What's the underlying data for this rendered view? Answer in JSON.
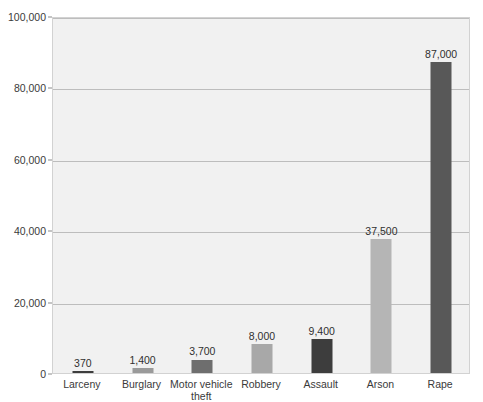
{
  "chart_data": {
    "type": "bar",
    "title": "",
    "subtitle": "",
    "xlabel": "",
    "ylabel": "",
    "categories": [
      "Larceny",
      "Burglary",
      "Motor vehicle\ntheft",
      "Robbery",
      "Assault",
      "Arson",
      "Rape"
    ],
    "values": [
      370,
      1400,
      3700,
      8000,
      9400,
      37500,
      87000
    ],
    "value_labels": [
      "370",
      "1,400",
      "3,700",
      "8,000",
      "9,400",
      "37,500",
      "87,000"
    ],
    "bar_colors": [
      "#3d3d3d",
      "#9a9a9a",
      "#6e6e6e",
      "#a8a8a8",
      "#3d3d3d",
      "#b5b5b5",
      "#585858"
    ],
    "ylim": [
      0,
      100000
    ],
    "ytick_values": [
      0,
      20000,
      40000,
      60000,
      80000,
      100000
    ],
    "ytick_labels": [
      "0",
      "20,000",
      "40,000",
      "60,000",
      "80,000",
      "100,000"
    ],
    "grid": true,
    "legend": null,
    "plot_background": "#f1f1f1",
    "gridline_color": "#bdbdbd",
    "axis_text_color": "#3a3a3a"
  }
}
